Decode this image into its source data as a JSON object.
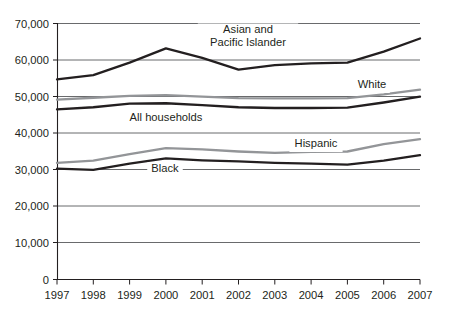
{
  "chart_data": {
    "type": "line",
    "title": "",
    "subtitle": "",
    "xlabel": "",
    "ylabel": "",
    "x": [
      1997,
      1998,
      1999,
      2000,
      2001,
      2002,
      2003,
      2004,
      2005,
      2006,
      2007
    ],
    "xtick_labels": [
      "1997",
      "1998",
      "1999",
      "2000",
      "2001",
      "2002",
      "2003",
      "2004",
      "2005",
      "2006",
      "2007"
    ],
    "ytick_labels": [
      "70,000",
      "60,000",
      "50,000",
      "40,000",
      "30,000",
      "20,000",
      "10,000",
      "0"
    ],
    "ytick_values": [
      70000,
      60000,
      50000,
      40000,
      30000,
      20000,
      10000,
      0
    ],
    "xlim": [
      1997,
      2007
    ],
    "ylim": [
      0,
      70000
    ],
    "grid": "horizontal",
    "legend": "inline-labels",
    "series": [
      {
        "name": "Asian and Pacific Islander",
        "label_lines": [
          "Asian and",
          "Pacific Islander"
        ],
        "color": "#231f20",
        "values": [
          54700,
          55900,
          59300,
          63200,
          60600,
          57400,
          58600,
          59100,
          59300,
          62300,
          65900
        ]
      },
      {
        "name": "White",
        "label_lines": [
          "White"
        ],
        "color": "#939598",
        "values": [
          49200,
          49700,
          50200,
          50400,
          50000,
          49600,
          49500,
          49500,
          49600,
          50600,
          51900
        ]
      },
      {
        "name": "All households",
        "label_lines": [
          "All households"
        ],
        "color": "#231f20",
        "values": [
          46500,
          47100,
          48100,
          48200,
          47700,
          47100,
          46900,
          46900,
          47000,
          48400,
          50000
        ]
      },
      {
        "name": "Hispanic",
        "label_lines": [
          "Hispanic"
        ],
        "color": "#939598",
        "values": [
          31900,
          32500,
          34300,
          35900,
          35600,
          35000,
          34600,
          34900,
          35000,
          37000,
          38400
        ]
      },
      {
        "name": "Black",
        "label_lines": [
          "Black"
        ],
        "color": "#231f20",
        "values": [
          30300,
          30000,
          31700,
          33100,
          32600,
          32300,
          31900,
          31700,
          31400,
          32500,
          34000
        ]
      }
    ],
    "annotations": [
      {
        "name": "asian-pacific-islander-label",
        "text_lines": [
          "Asian and",
          "Pacific Islander"
        ],
        "x": 248,
        "y": 33
      },
      {
        "name": "white-label",
        "text_lines": [
          "White"
        ],
        "x": 372,
        "y": 88
      },
      {
        "name": "all-households-label",
        "text_lines": [
          "All households"
        ],
        "x": 166,
        "y": 121
      },
      {
        "name": "hispanic-label",
        "text_lines": [
          "Hispanic"
        ],
        "x": 316,
        "y": 147
      },
      {
        "name": "black-label",
        "text_lines": [
          "Black"
        ],
        "x": 165,
        "y": 172
      }
    ]
  },
  "colors": {
    "dark_series": "#231f20",
    "gray_series": "#939598",
    "grid": "#58595b",
    "axis": "#231f20",
    "background": "#ffffff"
  }
}
